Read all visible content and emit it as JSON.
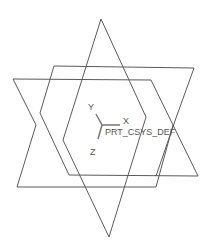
{
  "viewport": {
    "background": "#ffffff",
    "line_color": "#5a5a5a"
  },
  "csys": {
    "name": "PRT_CSYS_DEF",
    "axes": {
      "x": "X",
      "y": "Y",
      "z": "Z"
    },
    "axis_color": "#777777"
  },
  "datum_planes": [
    {
      "id": "plane-vertical",
      "points": "101,19 146,117 109,237 63,140"
    },
    {
      "id": "plane-back",
      "points": "54,66 194,68 160,176 13,79"
    },
    {
      "id": "plane-front",
      "points": "13,79 151,80 156,187 17,187"
    }
  ]
}
